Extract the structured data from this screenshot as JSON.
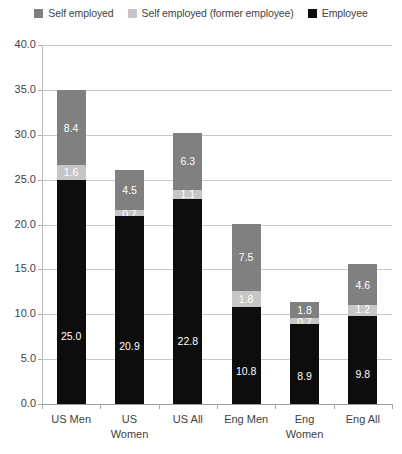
{
  "legend": {
    "position": "top-center",
    "items": [
      {
        "label": "Self employed",
        "color": "#808080",
        "icon": "square-swatch"
      },
      {
        "label": "Self employed (former employee)",
        "color": "#c6c6c6",
        "icon": "square-swatch"
      },
      {
        "label": "Employee",
        "color": "#0d0d0d",
        "icon": "square-swatch"
      }
    ]
  },
  "axis": {
    "y_ticks": [
      "0.0",
      "5.0",
      "10.0",
      "15.0",
      "20.0",
      "25.0",
      "30.0",
      "35.0",
      "40.0"
    ],
    "x_labels": [
      {
        "line1": "US Men",
        "line2": ""
      },
      {
        "line1": "US",
        "line2": "Women"
      },
      {
        "line1": "US All",
        "line2": ""
      },
      {
        "line1": "Eng Men",
        "line2": ""
      },
      {
        "line1": "Eng",
        "line2": "Women"
      },
      {
        "line1": "Eng All",
        "line2": ""
      }
    ]
  },
  "chart_data": {
    "type": "bar",
    "subtype": "stacked",
    "title": "",
    "subtitle": "",
    "xlabel": "",
    "ylabel": "",
    "ylim": [
      0,
      40
    ],
    "ytick_step": 5,
    "grid": true,
    "legend_position": "top-center",
    "categories": [
      "US Men",
      "US Women",
      "US All",
      "Eng Men",
      "Eng Women",
      "Eng All"
    ],
    "series": [
      {
        "name": "Employee",
        "color": "#0d0d0d",
        "values": [
          25.0,
          20.9,
          22.8,
          10.8,
          8.9,
          9.8
        ],
        "labels": [
          "25.0",
          "20.9",
          "22.8",
          "10.8",
          "8.9",
          "9.8"
        ]
      },
      {
        "name": "Self employed (former employee)",
        "color": "#c6c6c6",
        "values": [
          1.6,
          0.7,
          1.1,
          1.8,
          0.7,
          1.2
        ],
        "labels": [
          "1.6",
          "0.7",
          "1.1",
          "1.8",
          "0.7",
          "1.2"
        ]
      },
      {
        "name": "Self employed",
        "color": "#808080",
        "values": [
          8.4,
          4.5,
          6.3,
          7.5,
          1.8,
          4.6
        ],
        "labels": [
          "8.4",
          "4.5",
          "6.3",
          "7.5",
          "1.8",
          "4.6"
        ]
      }
    ],
    "totals": [
      35.0,
      26.1,
      30.2,
      20.1,
      11.4,
      15.6
    ]
  }
}
